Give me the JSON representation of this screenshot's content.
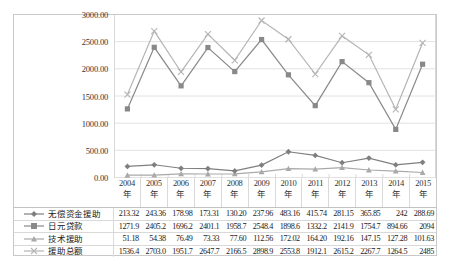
{
  "chart_data": {
    "type": "line",
    "title": "",
    "xlabel": "",
    "ylabel": "",
    "ylim": [
      0,
      3000
    ],
    "grid": true,
    "legend_position": "table-below",
    "categories": [
      "2004年",
      "2005年",
      "2006年",
      "2007年",
      "2008年",
      "2009年",
      "2010年",
      "2011年",
      "2012年",
      "2013年",
      "2014年",
      "2015年"
    ],
    "category_lines": [
      [
        "2004",
        "年"
      ],
      [
        "2005",
        "年"
      ],
      [
        "2006",
        "年"
      ],
      [
        "2007",
        "年"
      ],
      [
        "2008",
        "年"
      ],
      [
        "2009",
        "年"
      ],
      [
        "2010",
        "年"
      ],
      [
        "2011",
        "年"
      ],
      [
        "2012",
        "年"
      ],
      [
        "2013",
        "年"
      ],
      [
        "2014",
        "年"
      ],
      [
        "2015",
        "年"
      ]
    ],
    "y_ticks": [
      "0.00",
      "500.00",
      "1000.00",
      "1500.00",
      "2000.00",
      "2500.00",
      "3000.00"
    ],
    "y_tick_values": [
      0,
      500,
      1000,
      1500,
      2000,
      2500,
      3000
    ],
    "series": [
      {
        "name": "无偿资金援助",
        "marker": "diamond",
        "color": "#7f7f7f",
        "values": [
          213.32,
          243.36,
          178.98,
          173.31,
          130.2,
          237.96,
          483.16,
          415.74,
          281.15,
          365.85,
          242,
          288.69
        ],
        "labels": [
          "213.32",
          "243.36",
          "178.98",
          "173.31",
          "130.20",
          "237.96",
          "483.16",
          "415.74",
          "281.15",
          "365.85",
          "242",
          "288.69"
        ]
      },
      {
        "name": "日元贷款",
        "marker": "square",
        "color": "#898989",
        "values": [
          1271.9,
          2405.2,
          1696.2,
          2401.1,
          1958.7,
          2548.4,
          1898.6,
          1332.2,
          2141.9,
          1754.7,
          894.66,
          2094
        ],
        "labels": [
          "1271.9",
          "2405.2",
          "1696.2",
          "2401.1",
          "1958.7",
          "2548.4",
          "1898.6",
          "1332.2",
          "2141.9",
          "1754.7",
          "894.66",
          "2094"
        ]
      },
      {
        "name": "技术援助",
        "marker": "triangle",
        "color": "#a9a9a9",
        "values": [
          51.18,
          54.38,
          76.49,
          73.33,
          77.6,
          112.56,
          172.02,
          164.2,
          192.16,
          147.15,
          127.28,
          101.63
        ],
        "labels": [
          "51.18",
          "54.38",
          "76.49",
          "73.33",
          "77.60",
          "112.56",
          "172.02",
          "164.20",
          "192.16",
          "147.15",
          "127.28",
          "101.63"
        ]
      },
      {
        "name": "援助总额",
        "marker": "cross",
        "color": "#b5b5b5",
        "values": [
          1536.4,
          2703.0,
          1951.7,
          2647.7,
          2166.5,
          2898.9,
          2553.8,
          1912.1,
          2615.2,
          2267.7,
          1264.5,
          2485
        ],
        "labels": [
          "1536.4",
          "2703.0",
          "1951.7",
          "2647.7",
          "2166.5",
          "2898.9",
          "2553.8",
          "1912.1",
          "2615.2",
          "2267.7",
          "1264.5",
          "2485"
        ]
      }
    ],
    "colors": {
      "grid": "#e2e2e2",
      "border": "#c9c9c9",
      "text": "#222222"
    }
  }
}
